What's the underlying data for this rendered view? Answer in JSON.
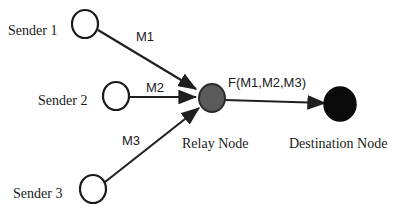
{
  "diagram": {
    "background_color": "#ffffff",
    "stroke_color": "#222222",
    "nodes": [
      {
        "id": "sender-1",
        "label": "Sender 1",
        "shape": "circle-outline",
        "fill": "#ffffff",
        "stroke": "#1a1a1a",
        "cx": 85,
        "cy": 24,
        "rx": 13,
        "ry": 14
      },
      {
        "id": "sender-2",
        "label": "Sender 2",
        "shape": "circle-outline",
        "fill": "#ffffff",
        "stroke": "#1a1a1a",
        "cx": 116,
        "cy": 96,
        "rx": 13,
        "ry": 14
      },
      {
        "id": "sender-3",
        "label": "Sender 3",
        "shape": "circle-outline",
        "fill": "#ffffff",
        "stroke": "#1a1a1a",
        "cx": 93,
        "cy": 189,
        "rx": 13,
        "ry": 14
      },
      {
        "id": "relay-node",
        "label": "Relay Node",
        "shape": "circle-filled",
        "fill": "#5a5a5a",
        "stroke": "#2b2b2b",
        "cx": 212,
        "cy": 98,
        "rx": 13,
        "ry": 14
      },
      {
        "id": "destination-node",
        "label": "Destination Node",
        "shape": "circle-filled",
        "fill": "#0a0a0a",
        "stroke": "#0a0a0a",
        "cx": 340,
        "cy": 104,
        "rx": 16,
        "ry": 17
      }
    ],
    "edges": [
      {
        "id": "edge-m1",
        "from": "sender-1",
        "to": "relay-node",
        "label": "M1",
        "directed": true
      },
      {
        "id": "edge-m2",
        "from": "sender-2",
        "to": "relay-node",
        "label": "M2",
        "directed": true
      },
      {
        "id": "edge-m3",
        "from": "sender-3",
        "to": "relay-node",
        "label": "M3",
        "directed": true
      },
      {
        "id": "edge-fused",
        "from": "relay-node",
        "to": "destination-node",
        "label": "F(M1,M2,M3)",
        "directed": true
      }
    ]
  }
}
